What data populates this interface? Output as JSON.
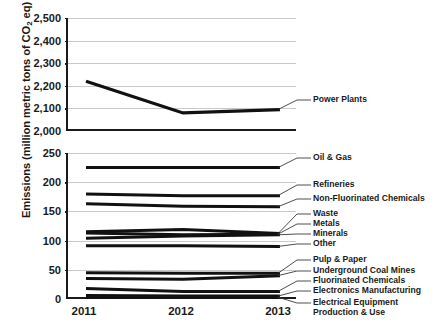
{
  "chart_data": {
    "type": "line",
    "title": "",
    "subtitle": "",
    "xlabel": "",
    "ylabel": "Emissions (million metric tons of CO2 eq)",
    "ylabel_parts": {
      "pre": "Emissions (million metric tons of CO",
      "sub": "2",
      "post": " eq)"
    },
    "x": [
      "2011",
      "2012",
      "2013"
    ],
    "categories": [
      "2011",
      "2012",
      "2013"
    ],
    "grid": true,
    "legend_position": "right-labels-with-leader-lines",
    "broken_axis": true,
    "panels": [
      {
        "name": "upper",
        "ylim": [
          2000,
          2500
        ],
        "yticks": [
          2000,
          2100,
          2200,
          2300,
          2400,
          2500
        ],
        "ytick_labels": [
          "2,000",
          "2,100",
          "2,200",
          "2,300",
          "2,400",
          "2,500"
        ]
      },
      {
        "name": "lower",
        "ylim": [
          0,
          250
        ],
        "yticks": [
          0,
          50,
          100,
          150,
          200,
          250
        ],
        "ytick_labels": [
          "0",
          "50",
          "100",
          "150",
          "200",
          "250"
        ]
      }
    ],
    "series": [
      {
        "name": "Power Plants",
        "panel": "upper",
        "values": [
          2220,
          2080,
          2095
        ],
        "label": "Power Plants"
      },
      {
        "name": "Oil & Gas",
        "panel": "lower",
        "values": [
          225,
          225,
          225
        ],
        "label": "Oil & Gas"
      },
      {
        "name": "Refineries",
        "panel": "lower",
        "values": [
          180,
          177,
          177
        ],
        "label": "Refineries"
      },
      {
        "name": "Non-Fluorinated Chemicals",
        "panel": "lower",
        "values": [
          163,
          159,
          158
        ],
        "label": "Non-Fluorinated Chemicals"
      },
      {
        "name": "Waste",
        "panel": "lower",
        "values": [
          115,
          119,
          112
        ],
        "label": "Waste"
      },
      {
        "name": "Metals",
        "panel": "lower",
        "values": [
          113,
          110,
          111
        ],
        "label": "Metals"
      },
      {
        "name": "Minerals",
        "panel": "lower",
        "values": [
          104,
          108,
          110
        ],
        "label": "Minerals"
      },
      {
        "name": "Other",
        "panel": "lower",
        "values": [
          91,
          91,
          90
        ],
        "label": "Other"
      },
      {
        "name": "Pulp & Paper",
        "panel": "lower",
        "values": [
          45,
          44,
          44
        ],
        "label": "Pulp & Paper"
      },
      {
        "name": "Underground Coal Mines",
        "panel": "lower",
        "values": [
          35,
          34,
          40
        ],
        "label": "Underground Coal Mines"
      },
      {
        "name": "Fluorinated Chemicals",
        "panel": "lower",
        "values": [
          18,
          13,
          13
        ],
        "label": "Fluorinated Chemicals"
      },
      {
        "name": "Electronics Manufacturing",
        "panel": "lower",
        "values": [
          6,
          5,
          5
        ],
        "label": "Electronics Manufacturing"
      },
      {
        "name": "Electrical Equipment Production & Use",
        "panel": "lower",
        "values": [
          3,
          3,
          3
        ],
        "label_line1": "Electrical Equipment",
        "label_line2": "Production & Use"
      }
    ],
    "legend_labels": [
      "Power Plants",
      "Oil & Gas",
      "Refineries",
      "Non-Fluorinated Chemicals",
      "Waste",
      "Metals",
      "Minerals",
      "Other",
      "Pulp & Paper",
      "Underground Coal Mines",
      "Fluorinated Chemicals",
      "Electronics Manufacturing",
      "Electrical Equipment Production & Use"
    ],
    "colors": {
      "line": "#111111",
      "grid": "#c9c9c9",
      "axis": "#1a1a1a",
      "background": "#ffffff",
      "text": "#1a1a1a"
    }
  }
}
